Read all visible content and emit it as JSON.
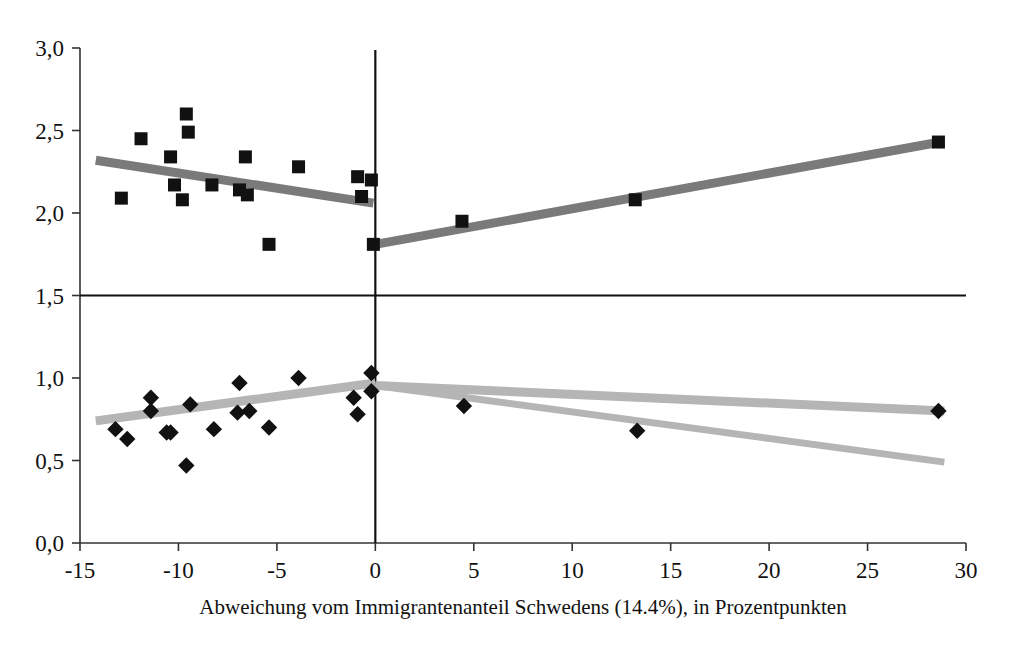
{
  "chart_data": {
    "type": "scatter",
    "title": "",
    "subtitle": "",
    "xlabel": "Abweichung vom Immigrantenanteil Schwedens (14.4%), in Prozentpunkten",
    "ylabel": "",
    "xlim": [
      -15,
      30
    ],
    "ylim": [
      0.0,
      3.0
    ],
    "xticks": [
      -15,
      -10,
      -5,
      0,
      5,
      10,
      15,
      20,
      25,
      30
    ],
    "xticklabels": [
      "-15",
      "-10",
      "-5",
      "0",
      "5",
      "10",
      "15",
      "20",
      "25",
      "30"
    ],
    "yticks": [
      0.0,
      0.5,
      1.0,
      1.5,
      2.0,
      2.5,
      3.0
    ],
    "yticklabels": [
      "0,0",
      "0,5",
      "1,0",
      "1,5",
      "2,0",
      "2,5",
      "3,0"
    ],
    "grid": false,
    "legend": "none",
    "reference_lines": [
      {
        "name": "horizontal-reference-1.5",
        "orientation": "horizontal",
        "value": 1.5,
        "color": "#111111"
      },
      {
        "name": "vertical-reference-0",
        "orientation": "vertical",
        "value": 0.0,
        "color": "#111111"
      }
    ],
    "series": [
      {
        "name": "upper-series-squares",
        "marker": "square",
        "color": "#111111",
        "points": [
          {
            "x": -12.9,
            "y": 2.09
          },
          {
            "x": -11.9,
            "y": 2.45
          },
          {
            "x": -10.4,
            "y": 2.34
          },
          {
            "x": -9.6,
            "y": 2.6
          },
          {
            "x": -9.5,
            "y": 2.49
          },
          {
            "x": -10.2,
            "y": 2.17
          },
          {
            "x": -9.8,
            "y": 2.08
          },
          {
            "x": -8.3,
            "y": 2.17
          },
          {
            "x": -6.9,
            "y": 2.14
          },
          {
            "x": -6.6,
            "y": 2.34
          },
          {
            "x": -6.5,
            "y": 2.11
          },
          {
            "x": -5.4,
            "y": 1.81
          },
          {
            "x": -3.9,
            "y": 2.28
          },
          {
            "x": -0.9,
            "y": 2.22
          },
          {
            "x": -0.2,
            "y": 2.2
          },
          {
            "x": -0.7,
            "y": 2.1
          },
          {
            "x": -0.1,
            "y": 1.81
          },
          {
            "x": 4.4,
            "y": 1.95
          },
          {
            "x": 13.2,
            "y": 2.08
          },
          {
            "x": 28.6,
            "y": 2.43
          }
        ]
      },
      {
        "name": "lower-series-diamonds",
        "marker": "diamond",
        "color": "#111111",
        "points": [
          {
            "x": -13.2,
            "y": 0.69
          },
          {
            "x": -12.6,
            "y": 0.63
          },
          {
            "x": -11.4,
            "y": 0.88
          },
          {
            "x": -11.4,
            "y": 0.8
          },
          {
            "x": -10.6,
            "y": 0.67
          },
          {
            "x": -10.4,
            "y": 0.67
          },
          {
            "x": -9.6,
            "y": 0.47
          },
          {
            "x": -9.4,
            "y": 0.84
          },
          {
            "x": -8.2,
            "y": 0.69
          },
          {
            "x": -6.9,
            "y": 0.97
          },
          {
            "x": -7.0,
            "y": 0.79
          },
          {
            "x": -6.4,
            "y": 0.8
          },
          {
            "x": -5.4,
            "y": 0.7
          },
          {
            "x": -3.9,
            "y": 1.0
          },
          {
            "x": -1.1,
            "y": 0.88
          },
          {
            "x": -0.9,
            "y": 0.78
          },
          {
            "x": -0.2,
            "y": 1.03
          },
          {
            "x": -0.2,
            "y": 0.92
          },
          {
            "x": 4.5,
            "y": 0.83
          },
          {
            "x": 13.3,
            "y": 0.68
          },
          {
            "x": 28.6,
            "y": 0.8
          }
        ]
      }
    ],
    "trend_lines": [
      {
        "name": "upper-left-trend",
        "color": "#7a7a7a",
        "width": 9,
        "x0": -14.2,
        "y0": 2.32,
        "x1": -0.1,
        "y1": 2.06
      },
      {
        "name": "upper-right-trend",
        "color": "#7a7a7a",
        "width": 9,
        "x0": 0.0,
        "y0": 1.81,
        "x1": 28.7,
        "y1": 2.43
      },
      {
        "name": "lower-left-trend",
        "color": "#b5b5b5",
        "width": 9,
        "x0": -14.2,
        "y0": 0.74,
        "x1": 0.0,
        "y1": 0.97
      },
      {
        "name": "lower-right-trend-shallow",
        "color": "#b5b5b5",
        "width": 9,
        "x0": 0.0,
        "y0": 0.955,
        "x1": 28.9,
        "y1": 0.8
      },
      {
        "name": "lower-right-trend-steep",
        "color": "#b5b5b5",
        "width": 7,
        "x0": 0.0,
        "y0": 0.955,
        "x1": 28.9,
        "y1": 0.49
      }
    ]
  },
  "caption": {
    "text": "Abweichung vom Immigrantenanteil Schwedens (14.4%), in Prozentpunkten"
  }
}
